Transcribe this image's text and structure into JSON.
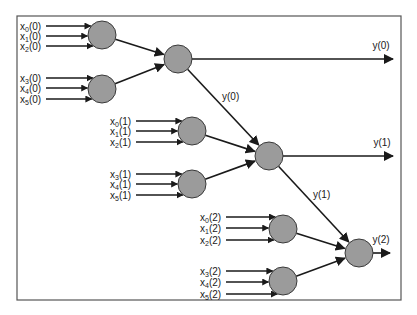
{
  "diagram": {
    "stages": [
      {
        "index": 0,
        "input_groups": [
          [
            {
              "name": "x",
              "sub": "0",
              "arg": "(0)"
            },
            {
              "name": "x",
              "sub": "1",
              "arg": "(0)"
            },
            {
              "name": "x",
              "sub": "2",
              "arg": "(0)"
            }
          ],
          [
            {
              "name": "x",
              "sub": "3",
              "arg": "(0)"
            },
            {
              "name": "x",
              "sub": "4",
              "arg": "(0)"
            },
            {
              "name": "x",
              "sub": "5",
              "arg": "(0)"
            }
          ]
        ],
        "output_label": "y(0)",
        "forward_label": "y(0)"
      },
      {
        "index": 1,
        "input_groups": [
          [
            {
              "name": "x",
              "sub": "0",
              "arg": "(1)"
            },
            {
              "name": "x",
              "sub": "1",
              "arg": "(1)"
            },
            {
              "name": "x",
              "sub": "2",
              "arg": "(1)"
            }
          ],
          [
            {
              "name": "x",
              "sub": "3",
              "arg": "(1)"
            },
            {
              "name": "x",
              "sub": "4",
              "arg": "(1)"
            },
            {
              "name": "x",
              "sub": "5",
              "arg": "(1)"
            }
          ]
        ],
        "output_label": "y(1)",
        "forward_label": "y(1)"
      },
      {
        "index": 2,
        "input_groups": [
          [
            {
              "name": "x",
              "sub": "0",
              "arg": "(2)"
            },
            {
              "name": "x",
              "sub": "1",
              "arg": "(2)"
            },
            {
              "name": "x",
              "sub": "2",
              "arg": "(2)"
            }
          ],
          [
            {
              "name": "x",
              "sub": "3",
              "arg": "(2)"
            },
            {
              "name": "x",
              "sub": "4",
              "arg": "(2)"
            },
            {
              "name": "x",
              "sub": "5",
              "arg": "(2)"
            }
          ]
        ],
        "output_label": "y(2)",
        "forward_label": ""
      }
    ],
    "colors": {
      "node_fill": "#9b9b9b",
      "node_stroke": "#3a3a3a",
      "edge": "#1a1a1a",
      "frame": "#555555"
    }
  }
}
